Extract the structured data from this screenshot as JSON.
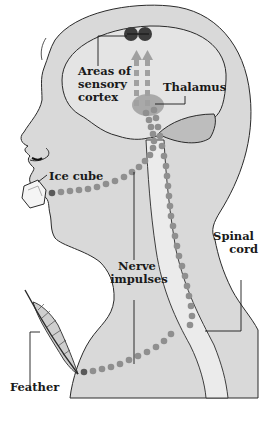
{
  "diagram": {
    "labels": {
      "sensory_cortex": [
        "Areas of",
        "sensory",
        "cortex"
      ],
      "thalamus": "Thalamus",
      "ice_cube": "Ice cube",
      "nerve_impulses": [
        "Nerve",
        "impulses"
      ],
      "spinal_cord": [
        "Spinal",
        "cord"
      ],
      "feather": "Feather"
    },
    "colors": {
      "skin": "#d9d9d9",
      "brain": "#e4e4e4",
      "spinal_cord": "#ebebeb",
      "dots": "#8f8f8f",
      "dot_start": "#5a5a5a",
      "cortex_spots": "#3c3c3c",
      "thalamus": "#a9a9a9",
      "cerebellum": "#bdbdbd",
      "outline": "#2a2a2a"
    }
  }
}
